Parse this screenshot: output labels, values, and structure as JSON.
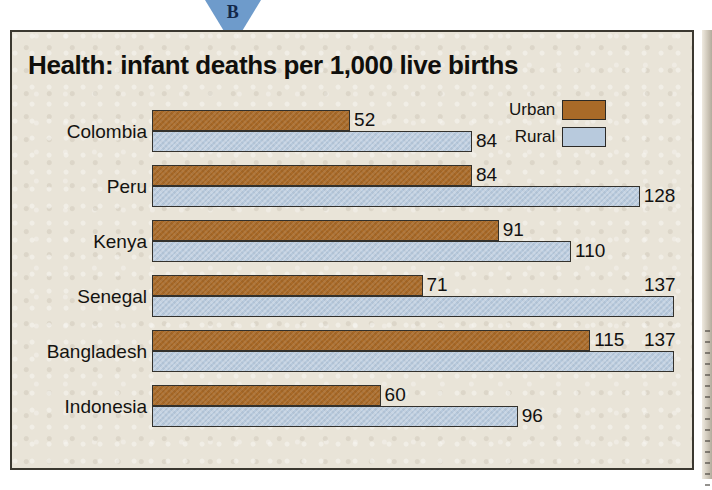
{
  "marker": {
    "letter": "B",
    "icon": "triangle-down-marker",
    "color": "#6e9bcb"
  },
  "panel": {
    "background_color": "#e9e4d8",
    "border_color": "#3b3830"
  },
  "legend": {
    "entries": [
      {
        "label": "Urban",
        "color": "#a96a28"
      },
      {
        "label": "Rural",
        "color": "#b8cadd"
      }
    ]
  },
  "chart_data": {
    "type": "bar",
    "orientation": "horizontal",
    "title": "Health: infant deaths per 1,000 live births",
    "xlabel": "",
    "ylabel": "",
    "categories": [
      "Colombia",
      "Peru",
      "Kenya",
      "Senegal",
      "Bangladesh",
      "Indonesia"
    ],
    "series": [
      {
        "name": "Urban",
        "color": "#a96a28",
        "values": [
          52,
          84,
          91,
          71,
          115,
          60
        ]
      },
      {
        "name": "Rural",
        "color": "#b8cadd",
        "values": [
          84,
          128,
          110,
          137,
          137,
          96
        ]
      }
    ],
    "xlim": [
      0,
      137
    ],
    "grid": false,
    "legend_position": "top-right",
    "data_labels": true,
    "axis_ticks_visible": false
  }
}
